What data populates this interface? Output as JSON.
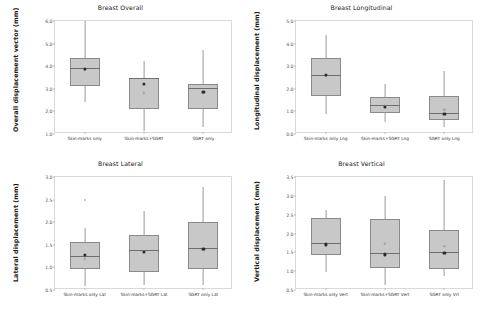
{
  "figure": {
    "background": "#ffffff",
    "box_fill": "#c8c8c8",
    "box_edge": "#8a8a8a",
    "whisker_color": "#9a9a9a",
    "mean_color": "#2b2b2b",
    "inner_color": "#a8a8a8"
  },
  "chart_data": [
    {
      "type": "box",
      "id": "breast-overall",
      "title": "Breast Overall",
      "xlabel": "",
      "ylabel": "Overall displacement vector (mm)",
      "ylim": [
        1.0,
        6.0
      ],
      "yticks": [
        "6.0",
        "5.0",
        "4.0",
        "3.0",
        "2.0",
        "1.0"
      ],
      "ytick_values": [
        6.0,
        5.0,
        4.0,
        3.0,
        2.0,
        1.0
      ],
      "grid": false,
      "legend": "none",
      "categories": [
        "Skin-marks only",
        "Skin-marks+SGRT",
        "SGRT only"
      ],
      "boxes": [
        {
          "label": "Skin-marks only",
          "whisker_low": 2.4,
          "q1": 3.12,
          "median": 3.92,
          "q3": 4.38,
          "whisker_high": 6.0,
          "mean": 3.93,
          "inner": 3.88,
          "outliers": []
        },
        {
          "label": "Skin-marks+SGRT",
          "whisker_low": 1.15,
          "q1": 2.12,
          "median": 3.48,
          "q3": 3.5,
          "whisker_high": 4.22,
          "mean": 3.27,
          "inner": 2.88,
          "outliers": []
        },
        {
          "label": "SGRT only",
          "whisker_low": 1.32,
          "q1": 2.1,
          "median": 3.02,
          "q3": 3.2,
          "whisker_high": 4.7,
          "mean": 2.92,
          "inner": 2.88,
          "outliers": []
        }
      ]
    },
    {
      "type": "box",
      "id": "breast-longitudinal",
      "title": "Breast Longitudinal",
      "xlabel": "",
      "ylabel": "Longitudinal displacement (mm)",
      "ylim": [
        0.0,
        5.0
      ],
      "yticks": [
        "5.0",
        "4.0",
        "3.0",
        "2.0",
        "1.0",
        "0.0"
      ],
      "ytick_values": [
        5.0,
        4.0,
        3.0,
        2.0,
        1.0,
        0.0
      ],
      "grid": false,
      "legend": "none",
      "categories": [
        "Skin-marks only Lng",
        "Skin-marks+SGRT Lng",
        "SGRT only Lng"
      ],
      "boxes": [
        {
          "label": "Skin-marks only Lng",
          "whisker_low": 0.9,
          "q1": 1.68,
          "median": 2.62,
          "q3": 3.35,
          "whisker_high": 4.38,
          "mean": 2.66,
          "inner": 2.62,
          "outliers": []
        },
        {
          "label": "Skin-marks+SGRT Lng",
          "whisker_low": 0.52,
          "q1": 0.92,
          "median": 1.28,
          "q3": 1.65,
          "whisker_high": 2.22,
          "mean": 1.25,
          "inner": 1.32,
          "outliers": []
        },
        {
          "label": "SGRT only Lng",
          "whisker_low": 0.3,
          "q1": 0.62,
          "median": 0.95,
          "q3": 1.7,
          "whisker_high": 2.78,
          "mean": 0.95,
          "inner": 1.12,
          "outliers": []
        }
      ]
    },
    {
      "type": "box",
      "id": "breast-lateral",
      "title": "Breast Lateral",
      "xlabel": "",
      "ylabel": "Lateral displacement (mm)",
      "ylim": [
        0.5,
        3.0
      ],
      "yticks": [
        "3.0",
        "2.5",
        "2.0",
        "1.5",
        "1.0",
        "0.5"
      ],
      "ytick_values": [
        3.0,
        2.5,
        2.0,
        1.5,
        1.0,
        0.5
      ],
      "grid": false,
      "legend": "none",
      "categories": [
        "Skin-marks only Lat",
        "Skin-marks+SGRT Lat",
        "SGRT only Lat"
      ],
      "boxes": [
        {
          "label": "Skin-marks only Lat",
          "whisker_low": 0.58,
          "q1": 0.96,
          "median": 1.26,
          "q3": 1.56,
          "whisker_high": 1.88,
          "mean": 1.3,
          "inner": 1.22,
          "outliers": [
            2.52
          ]
        },
        {
          "label": "Skin-marks+SGRT Lat",
          "whisker_low": 0.62,
          "q1": 0.9,
          "median": 1.38,
          "q3": 1.72,
          "whisker_high": 2.24,
          "mean": 1.38,
          "inner": 1.38,
          "outliers": []
        },
        {
          "label": "SGRT only Lat",
          "whisker_low": 0.6,
          "q1": 0.96,
          "median": 1.42,
          "q3": 2.0,
          "whisker_high": 2.78,
          "mean": 1.44,
          "inner": 1.42,
          "outliers": []
        }
      ]
    },
    {
      "type": "box",
      "id": "breast-vertical",
      "title": "Breast Vertical",
      "xlabel": "",
      "ylabel": "Vertical displacement (mm)",
      "ylim": [
        0.5,
        3.5
      ],
      "yticks": [
        "3.5",
        "3.0",
        "2.5",
        "2.0",
        "1.5",
        "1.0",
        "0.5"
      ],
      "ytick_values": [
        3.5,
        3.0,
        2.5,
        2.0,
        1.5,
        1.0,
        0.5
      ],
      "grid": false,
      "legend": "none",
      "categories": [
        "Skin-marks only Vert",
        "Skin-marks+SGRT Vert",
        "SGRT only Vrt"
      ],
      "boxes": [
        {
          "label": "Skin-marks only Vert",
          "whisker_low": 0.97,
          "q1": 1.44,
          "median": 1.74,
          "q3": 2.4,
          "whisker_high": 2.62,
          "mean": 1.75,
          "inner": 1.74,
          "outliers": []
        },
        {
          "label": "Skin-marks+SGRT Vert",
          "whisker_low": 0.64,
          "q1": 1.08,
          "median": 1.48,
          "q3": 2.38,
          "whisker_high": 3.0,
          "mean": 1.48,
          "inner": 1.76,
          "outliers": []
        },
        {
          "label": "SGRT only Vrt",
          "whisker_low": 0.88,
          "q1": 1.06,
          "median": 1.52,
          "q3": 2.1,
          "whisker_high": 3.42,
          "mean": 1.52,
          "inner": 1.7,
          "outliers": []
        }
      ]
    }
  ]
}
